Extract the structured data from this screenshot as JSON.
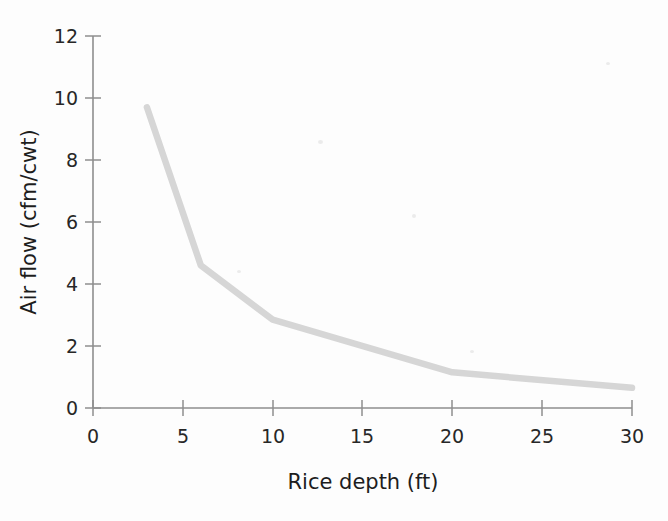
{
  "chart_data": {
    "type": "line",
    "title": "",
    "xlabel": "Rice depth (ft)",
    "ylabel": "Air flow (cfm/cwt)",
    "xlim": [
      0,
      30
    ],
    "ylim": [
      0,
      12
    ],
    "xticks": [
      0,
      5,
      10,
      15,
      20,
      25,
      30
    ],
    "yticks": [
      0,
      2,
      4,
      6,
      8,
      10,
      12
    ],
    "xtick_labels": [
      "0",
      "5",
      "10",
      "15",
      "20",
      "25",
      "30"
    ],
    "ytick_labels": [
      "0",
      "2",
      "4",
      "6",
      "8",
      "10",
      "12"
    ],
    "grid": false,
    "legend": false,
    "legend_position": "none",
    "line_color": "#d6d6d6",
    "axis_color": "#8e8e8e",
    "series": [
      {
        "name": "Air flow vs rice depth",
        "x": [
          3,
          6,
          10,
          20,
          30
        ],
        "values": [
          9.7,
          4.6,
          2.85,
          1.15,
          0.65
        ]
      }
    ]
  },
  "axes": {
    "x_title": "Rice depth (ft)",
    "y_title": "Air flow (cfm/cwt)"
  }
}
